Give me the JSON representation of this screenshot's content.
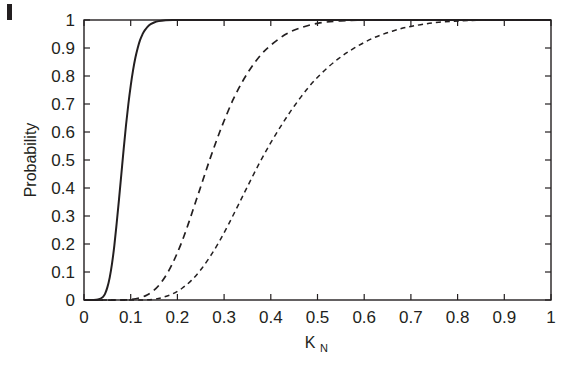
{
  "figure": {
    "background_color": "#ffffff",
    "axis_color": "#231f20",
    "curve_color": "#231f20",
    "corner_mark": "page-edge-artifact"
  },
  "chart_data": {
    "type": "line",
    "title": "",
    "xlabel": "K_N",
    "xlabel_base": "K",
    "xlabel_sub": "N",
    "ylabel": "Probability",
    "xlim": [
      0,
      1
    ],
    "ylim": [
      0,
      1
    ],
    "grid": false,
    "legend": "none",
    "xticks": [
      0,
      0.1,
      0.2,
      0.3,
      0.4,
      0.5,
      0.6,
      0.7,
      0.8,
      0.9,
      1
    ],
    "xticklabels": [
      "0",
      "0.1",
      "0.2",
      "0.3",
      "0.4",
      "0.5",
      "0.6",
      "0.7",
      "0.8",
      "0.9",
      "1"
    ],
    "yticks": [
      0,
      0.1,
      0.2,
      0.3,
      0.4,
      0.5,
      0.6,
      0.7,
      0.8,
      0.9,
      1
    ],
    "yticklabels": [
      "0",
      "0.1",
      "0.2",
      "0.3",
      "0.4",
      "0.5",
      "0.6",
      "0.7",
      "0.8",
      "0.9",
      "1"
    ],
    "series": [
      {
        "name": "curve-1",
        "style": "solid",
        "x": [
          0.0,
          0.02,
          0.03,
          0.04,
          0.045,
          0.05,
          0.055,
          0.06,
          0.065,
          0.07,
          0.075,
          0.08,
          0.085,
          0.09,
          0.095,
          0.1,
          0.105,
          0.11,
          0.115,
          0.12,
          0.125,
          0.13,
          0.14,
          0.15,
          0.16,
          0.175,
          0.19,
          0.21,
          0.25,
          0.4,
          0.7,
          1.0
        ],
        "y": [
          0.0,
          0.0,
          0.002,
          0.01,
          0.022,
          0.045,
          0.08,
          0.13,
          0.195,
          0.275,
          0.36,
          0.45,
          0.54,
          0.625,
          0.7,
          0.765,
          0.82,
          0.865,
          0.9,
          0.928,
          0.948,
          0.963,
          0.982,
          0.991,
          0.996,
          0.999,
          1.0,
          1.0,
          1.0,
          1.0,
          1.0,
          1.0
        ]
      },
      {
        "name": "curve-2",
        "style": "dashed",
        "x": [
          0.0,
          0.08,
          0.1,
          0.12,
          0.135,
          0.15,
          0.165,
          0.18,
          0.195,
          0.21,
          0.225,
          0.24,
          0.255,
          0.27,
          0.285,
          0.3,
          0.32,
          0.34,
          0.36,
          0.38,
          0.4,
          0.43,
          0.46,
          0.5,
          0.55,
          0.62,
          0.75,
          1.0
        ],
        "y": [
          0.0,
          0.0,
          0.002,
          0.008,
          0.018,
          0.035,
          0.062,
          0.1,
          0.15,
          0.21,
          0.28,
          0.355,
          0.43,
          0.505,
          0.575,
          0.64,
          0.718,
          0.782,
          0.835,
          0.878,
          0.91,
          0.947,
          0.97,
          0.988,
          0.997,
          1.0,
          1.0,
          1.0
        ]
      },
      {
        "name": "curve-3",
        "style": "dashed-fine",
        "x": [
          0.0,
          0.12,
          0.15,
          0.17,
          0.19,
          0.21,
          0.23,
          0.25,
          0.27,
          0.29,
          0.31,
          0.33,
          0.35,
          0.375,
          0.4,
          0.425,
          0.45,
          0.48,
          0.51,
          0.545,
          0.58,
          0.62,
          0.66,
          0.7,
          0.76,
          0.85,
          1.0
        ],
        "y": [
          0.0,
          0.0,
          0.003,
          0.01,
          0.022,
          0.042,
          0.07,
          0.108,
          0.155,
          0.21,
          0.272,
          0.338,
          0.405,
          0.487,
          0.562,
          0.63,
          0.692,
          0.758,
          0.812,
          0.862,
          0.901,
          0.936,
          0.96,
          0.977,
          0.992,
          0.999,
          1.0
        ]
      }
    ]
  }
}
